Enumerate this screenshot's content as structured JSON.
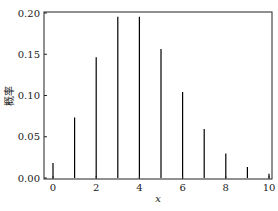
{
  "chart_data": {
    "type": "bar",
    "style": "stem",
    "title": "",
    "xlabel": "x",
    "ylabel": "概率",
    "x": [
      0,
      1,
      2,
      3,
      4,
      5,
      6,
      7,
      8,
      9,
      10
    ],
    "values": [
      0.0183,
      0.0733,
      0.1465,
      0.1954,
      0.1954,
      0.1563,
      0.1042,
      0.0595,
      0.0298,
      0.0132,
      0.0053
    ],
    "xticks": [
      "0",
      "2",
      "4",
      "6",
      "8",
      "10"
    ],
    "yticks": [
      "0.00",
      "0.05",
      "0.10",
      "0.15",
      "0.20"
    ],
    "xlim": [
      -0.5,
      10.5
    ],
    "ylim": [
      0,
      0.2
    ],
    "grid": false,
    "legend": null,
    "color": "#000000"
  }
}
